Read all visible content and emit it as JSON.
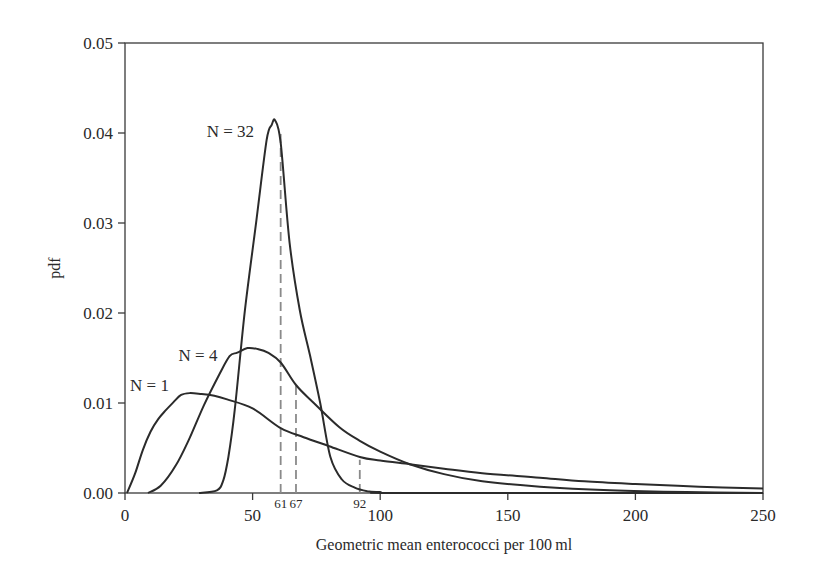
{
  "chart_data": {
    "type": "line",
    "title": "",
    "xlabel": "Geometric mean enterococci per 100 ml",
    "ylabel": "pdf",
    "xlim": [
      0,
      250
    ],
    "ylim": [
      0,
      0.05
    ],
    "grid": false,
    "legend": "none (inline curve labels)",
    "x_ticks": [
      0,
      50,
      100,
      150,
      200,
      250
    ],
    "x_tick_labels": [
      "0",
      "50",
      "100",
      "150",
      "200",
      "250"
    ],
    "y_ticks": [
      0,
      0.01,
      0.02,
      0.03,
      0.04,
      0.05
    ],
    "y_tick_labels": [
      "0.00",
      "0.01",
      "0.02",
      "0.03",
      "0.04",
      "0.05"
    ],
    "series": [
      {
        "name": "N=1",
        "label": "N = 1",
        "label_pos": [
          2,
          0.0113
        ],
        "x": [
          0.8,
          4,
          7,
          10,
          13,
          16,
          19,
          22,
          25.5,
          30,
          35,
          40,
          50,
          61,
          70,
          80,
          92,
          100,
          111.6,
          125,
          140,
          162.6,
          180,
          200,
          225,
          250
        ],
        "y": [
          0,
          0.0022,
          0.0048,
          0.0068,
          0.0082,
          0.0092,
          0.0101,
          0.0109,
          0.0111,
          0.011,
          0.0108,
          0.0104,
          0.0094,
          0.0072,
          0.0062,
          0.0052,
          0.004,
          0.0036,
          0.0032,
          0.0027,
          0.0022,
          0.0017,
          0.0013,
          0.001,
          0.0007,
          0.0005
        ]
      },
      {
        "name": "N=4",
        "label": "N = 4",
        "label_pos": [
          21,
          0.0147
        ],
        "x": [
          9,
          14,
          20,
          25,
          31,
          37,
          41,
          44,
          48,
          52,
          56,
          61,
          67,
          74,
          84,
          92,
          100,
          111.6,
          125,
          140,
          162.6,
          190,
          220,
          250
        ],
        "y": [
          0,
          0.0008,
          0.0031,
          0.0059,
          0.0098,
          0.0132,
          0.0152,
          0.0156,
          0.0161,
          0.016,
          0.0156,
          0.0145,
          0.012,
          0.01,
          0.0073,
          0.0058,
          0.0046,
          0.0032,
          0.0021,
          0.0013,
          0.0007,
          0.0003,
          0.0001,
          0.0
        ]
      },
      {
        "name": "N=32",
        "label": "N = 32",
        "label_pos": [
          32,
          0.0396
        ],
        "x": [
          29,
          36,
          38.5,
          40.5,
          43,
          47,
          51.5,
          55.5,
          57.5,
          58.8,
          61,
          64.5,
          68.5,
          72.5,
          76.5,
          80.5,
          85,
          90,
          95,
          100,
          110,
          250
        ],
        "y": [
          0,
          0.0003,
          0.0014,
          0.004,
          0.0092,
          0.0203,
          0.0303,
          0.0392,
          0.0409,
          0.0414,
          0.0389,
          0.0278,
          0.0203,
          0.0153,
          0.01,
          0.004,
          0.0015,
          0.0006,
          0.0002,
          0.0001,
          0,
          0
        ]
      }
    ],
    "annotations": [
      {
        "type": "vline_dashed",
        "x": 61,
        "y_top": 0.04,
        "label": "61",
        "series": "N=32"
      },
      {
        "type": "vline_dashed",
        "x": 67,
        "y_top": 0.012,
        "label": "67",
        "series": "N=4"
      },
      {
        "type": "vline_dashed",
        "x": 92,
        "y_top": 0.0037,
        "label": "92",
        "series": "N=1"
      }
    ]
  },
  "plot_area": {
    "left": 125,
    "right": 763,
    "top": 43,
    "bottom": 493
  }
}
